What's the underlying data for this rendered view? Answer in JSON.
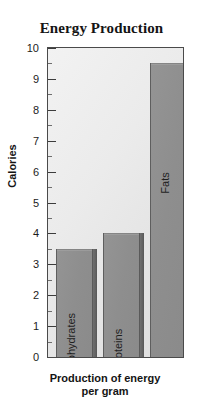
{
  "chart_data": {
    "type": "bar",
    "title": "Energy Production",
    "xlabel": "Production of energy per gram",
    "xlabel_line1": "Production of energy",
    "xlabel_line2": "per gram",
    "ylabel": "Calories",
    "categories": [
      "Carbohydrates",
      "Proteins",
      "Fats"
    ],
    "values": [
      3.5,
      4,
      9.5
    ],
    "ylim": [
      0,
      10
    ],
    "ytick_labels": [
      "10",
      "9",
      "8",
      "7",
      "6",
      "5",
      "4",
      "3",
      "2",
      "1",
      "0"
    ],
    "ytick_values": [
      10,
      9,
      8,
      7,
      6,
      5,
      4,
      3,
      2,
      1,
      0
    ],
    "minor_tick_values": [
      9.5,
      8.5,
      7.5,
      6.5,
      5.5,
      4.5,
      3.5,
      2.5,
      1.5,
      0.5
    ],
    "grid": false,
    "legend": "none",
    "bar_color": "#8e8e8e",
    "bar_edge_color": "#5e5e5e",
    "plot_background": "#eaeaea",
    "axis_color": "#4a4a4a",
    "text_color": "#141414"
  }
}
